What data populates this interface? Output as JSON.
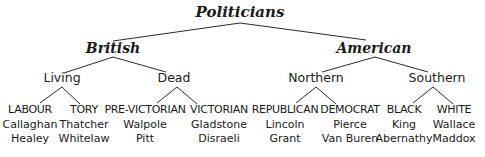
{
  "diagram": {
    "type": "tree",
    "root": {
      "label": "Politicians",
      "x": 240,
      "children": [
        {
          "label": "British",
          "x": 113,
          "children": [
            {
              "label": "Living",
              "x": 62,
              "children": [
                {
                  "label": "LABOUR",
                  "x": 30,
                  "members": [
                    "Callaghan",
                    "Healey"
                  ]
                },
                {
                  "label": "TORY",
                  "x": 84,
                  "members": [
                    "Thatcher",
                    "Whitelaw"
                  ]
                }
              ]
            },
            {
              "label": "Dead",
              "x": 174,
              "children": [
                {
                  "label": "PRE-VICTORIAN",
                  "x": 145,
                  "members": [
                    "Walpole",
                    "Pitt"
                  ]
                },
                {
                  "label": "VICTORIAN",
                  "x": 219,
                  "members": [
                    "Gladstone",
                    "Disraeli"
                  ]
                }
              ]
            }
          ]
        },
        {
          "label": "American",
          "x": 374,
          "children": [
            {
              "label": "Northern",
              "x": 316,
              "children": [
                {
                  "label": "REPUBLICAN",
                  "x": 285,
                  "members": [
                    "Lincoln",
                    "Grant"
                  ]
                },
                {
                  "label": "DEMOCRAT",
                  "x": 350,
                  "members": [
                    "Pierce",
                    "Van Buren"
                  ]
                }
              ]
            },
            {
              "label": "Southern",
              "x": 437,
              "children": [
                {
                  "label": "BLACK",
                  "x": 404,
                  "members": [
                    "King",
                    "Abernathy"
                  ]
                },
                {
                  "label": "WHITE",
                  "x": 454,
                  "members": [
                    "Wallace",
                    "Maddox"
                  ]
                }
              ]
            }
          ]
        }
      ]
    }
  },
  "colors": {
    "text": "#1a1a1a",
    "lines": "#2a2a2a",
    "background": "#ffffff"
  }
}
